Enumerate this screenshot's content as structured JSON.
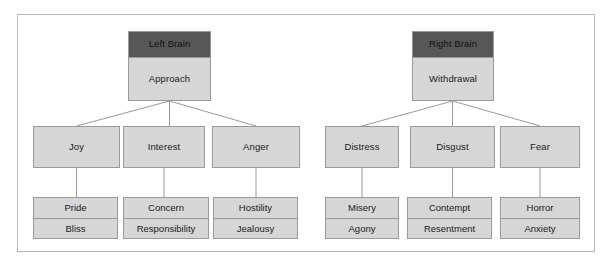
{
  "diagram": {
    "colors": {
      "frame_border": "#b9b9b9",
      "node_fill": "#d6d6d6",
      "node_border": "#9a9a9a",
      "header_fill": "#575757",
      "connector": "#9a9a9a",
      "background": "#ffffff",
      "text": "#1a1a1a"
    },
    "branches": [
      {
        "id": "left",
        "root": {
          "header": "Left Brain",
          "body": "Approach"
        },
        "children": [
          {
            "label": "Joy",
            "leaves": [
              "Pride",
              "Bliss"
            ]
          },
          {
            "label": "Interest",
            "leaves": [
              "Concern",
              "Responsibility"
            ]
          },
          {
            "label": "Anger",
            "leaves": [
              "Hostility",
              "Jealousy"
            ]
          }
        ]
      },
      {
        "id": "right",
        "root": {
          "header": "Right Brain",
          "body": "Withdrawal"
        },
        "children": [
          {
            "label": "Distress",
            "leaves": [
              "Misery",
              "Agony"
            ]
          },
          {
            "label": "Disgust",
            "leaves": [
              "Contempt",
              "Resentment"
            ]
          },
          {
            "label": "Fear",
            "leaves": [
              "Horror",
              "Anxiety"
            ]
          }
        ]
      }
    ]
  }
}
